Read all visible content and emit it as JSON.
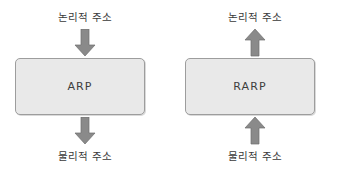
{
  "diagram": {
    "background_color": "#ffffff",
    "box_fill_color": "#e9e9e9",
    "box_border_color": "#9d9d9d",
    "arrow_color": "#8a8a8a",
    "text_color": "#3a3a3a",
    "panels": [
      {
        "name": "arp",
        "box_label": "ARP",
        "top_label": "논리적 주소",
        "bottom_label": "물리적 주소",
        "top_arrow_direction": "down",
        "bottom_arrow_direction": "down"
      },
      {
        "name": "rarp",
        "box_label": "RARP",
        "top_label": "논리적 주소",
        "bottom_label": "물리적 주소",
        "top_arrow_direction": "up",
        "bottom_arrow_direction": "up"
      }
    ]
  }
}
